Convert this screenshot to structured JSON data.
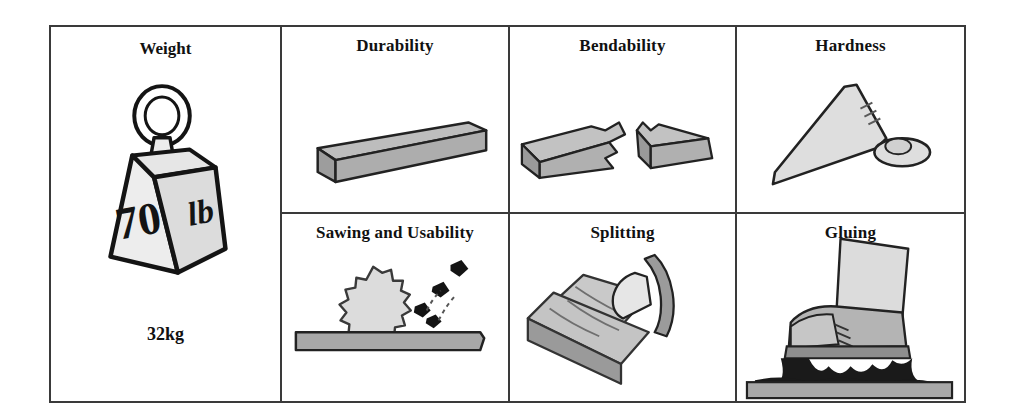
{
  "table": {
    "weight_cell": {
      "title": "Weight",
      "icon": "weight-block-icon",
      "face_left_label": "70",
      "face_right_label": "lb",
      "caption": "32kg"
    },
    "cells": [
      {
        "title": "Durability",
        "icon": "wooden-beam-icon"
      },
      {
        "title": "Bendability",
        "icon": "broken-beam-icon"
      },
      {
        "title": "Hardness",
        "icon": "bent-nail-icon"
      },
      {
        "title": "Sawing and Usability",
        "icon": "circular-saw-blade-icon"
      },
      {
        "title": "Splitting",
        "icon": "axe-and-split-wood-icon"
      },
      {
        "title": "Gluing",
        "icon": "boot-stuck-in-glue-icon"
      }
    ]
  },
  "colors": {
    "border": "#3a3a3a",
    "ink": "#111111",
    "light_gray": "#d9d9d9",
    "mid_gray": "#b0b0b0",
    "dark_gray": "#8f8f8f",
    "black_fill": "#141414",
    "background": "#ffffff"
  }
}
